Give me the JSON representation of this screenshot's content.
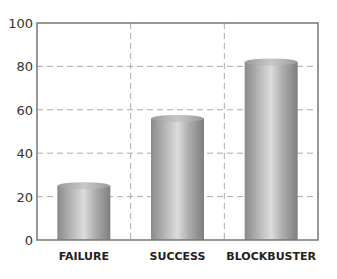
{
  "chart_data": {
    "type": "bar",
    "title": "",
    "xlabel": "",
    "ylabel": "",
    "categories": [
      "FAILURE",
      "SUCCESS",
      "BLOCKBUSTER"
    ],
    "values": [
      25,
      56,
      82
    ],
    "ylim": [
      0,
      100
    ],
    "yticks": [
      0,
      20,
      40,
      60,
      80,
      100
    ],
    "grid": true,
    "grid_style": "dashed",
    "bar_style": "3d-cylinder",
    "legend": null,
    "colors": {
      "bar_light": "#d8d8d8",
      "bar_dark": "#8a8a8a",
      "grid": "#aaaaaa",
      "axis": "#777777"
    }
  }
}
